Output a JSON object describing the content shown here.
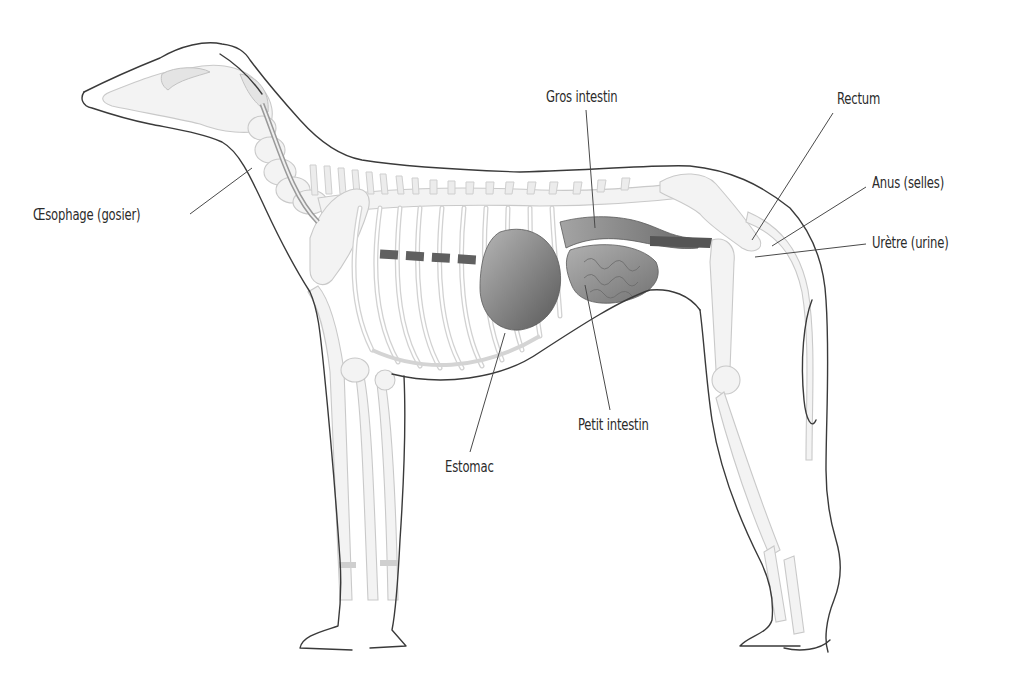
{
  "diagram": {
    "colors": {
      "outline": "#3a3a3a",
      "bone": "#f3f3f3",
      "organ_dark": "#5e5e5e",
      "organ_mid": "#8a8a8a",
      "organ_light": "#b4b4b4",
      "text": "#2b2b2b"
    },
    "labels": [
      {
        "id": "oesophagus",
        "text": "Œsophage (gosier)",
        "x": 33,
        "y": 208,
        "line": [
          190,
          214,
          252,
          168
        ]
      },
      {
        "id": "large-intestine",
        "text": "Gros intestin",
        "x": 546,
        "y": 89,
        "line": [
          586,
          110,
          595,
          228
        ]
      },
      {
        "id": "rectum",
        "text": "Rectum",
        "x": 837,
        "y": 91,
        "line": [
          833,
          113,
          752,
          240
        ]
      },
      {
        "id": "anus",
        "text": "Anus (selles)",
        "x": 872,
        "y": 175,
        "line": [
          866,
          187,
          772,
          246
        ]
      },
      {
        "id": "urethra",
        "text": "Urètre (urine)",
        "x": 872,
        "y": 235,
        "line": [
          866,
          244,
          755,
          257
        ]
      },
      {
        "id": "small-intestine",
        "text": "Petit intestin",
        "x": 578,
        "y": 418,
        "line": [
          610,
          410,
          585,
          285
        ]
      },
      {
        "id": "stomach",
        "text": "Estomac",
        "x": 445,
        "y": 460,
        "line": [
          470,
          452,
          505,
          333
        ]
      }
    ]
  }
}
